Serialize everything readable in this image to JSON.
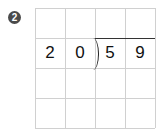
{
  "problem": {
    "number_badge": "2",
    "divisor": [
      "2",
      "0"
    ],
    "dividend": [
      "5",
      "9"
    ],
    "grid": {
      "rows": 4,
      "cols": 4
    }
  }
}
